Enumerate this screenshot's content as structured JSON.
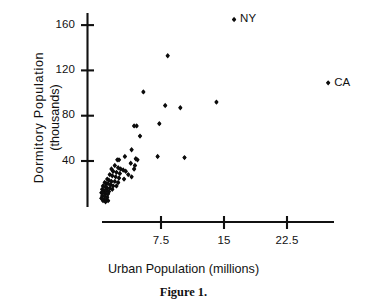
{
  "chart_data": {
    "type": "scatter",
    "title": "",
    "caption": "Figure 1.",
    "xlabel": "Urban Population (millions)",
    "ylabel_line1": "Dormitory  Population",
    "ylabel_line2": "(thousands)",
    "xlim": [
      0,
      28
    ],
    "ylim": [
      0,
      178
    ],
    "grid": false,
    "legend": "none",
    "xticks": [
      7.5,
      15,
      22.5
    ],
    "xtick_labels": [
      "7.5",
      "15",
      "22.5"
    ],
    "yticks": [
      40,
      80,
      120,
      160
    ],
    "ytick_labels": [
      "40",
      "80",
      "120",
      "160"
    ],
    "marker": "filled-diamond",
    "point_label_NY": "NY",
    "point_label_CA": "CA",
    "points": [
      {
        "x": 16.2,
        "y": 165,
        "label": "NY"
      },
      {
        "x": 27.4,
        "y": 109,
        "label": "CA"
      },
      {
        "x": 8.3,
        "y": 133
      },
      {
        "x": 5.4,
        "y": 101
      },
      {
        "x": 8.0,
        "y": 89
      },
      {
        "x": 9.8,
        "y": 87
      },
      {
        "x": 14.1,
        "y": 92
      },
      {
        "x": 7.3,
        "y": 73
      },
      {
        "x": 4.6,
        "y": 71
      },
      {
        "x": 4.3,
        "y": 71
      },
      {
        "x": 5.0,
        "y": 62
      },
      {
        "x": 4.0,
        "y": 50
      },
      {
        "x": 3.2,
        "y": 44
      },
      {
        "x": 4.5,
        "y": 42
      },
      {
        "x": 4.7,
        "y": 41
      },
      {
        "x": 7.1,
        "y": 44
      },
      {
        "x": 10.3,
        "y": 43
      },
      {
        "x": 2.5,
        "y": 41
      },
      {
        "x": 2.3,
        "y": 41
      },
      {
        "x": 3.9,
        "y": 38
      },
      {
        "x": 4.4,
        "y": 36
      },
      {
        "x": 4.3,
        "y": 33
      },
      {
        "x": 2.0,
        "y": 36
      },
      {
        "x": 2.4,
        "y": 34
      },
      {
        "x": 2.7,
        "y": 33
      },
      {
        "x": 3.0,
        "y": 32
      },
      {
        "x": 3.3,
        "y": 31
      },
      {
        "x": 1.6,
        "y": 33
      },
      {
        "x": 1.8,
        "y": 31
      },
      {
        "x": 2.2,
        "y": 30
      },
      {
        "x": 2.6,
        "y": 29
      },
      {
        "x": 3.6,
        "y": 28
      },
      {
        "x": 4.0,
        "y": 26
      },
      {
        "x": 1.4,
        "y": 28
      },
      {
        "x": 1.7,
        "y": 27
      },
      {
        "x": 2.1,
        "y": 26
      },
      {
        "x": 2.5,
        "y": 25
      },
      {
        "x": 3.1,
        "y": 24
      },
      {
        "x": 1.1,
        "y": 24
      },
      {
        "x": 1.3,
        "y": 23
      },
      {
        "x": 1.6,
        "y": 22
      },
      {
        "x": 2.0,
        "y": 22
      },
      {
        "x": 2.4,
        "y": 21
      },
      {
        "x": 0.8,
        "y": 21
      },
      {
        "x": 1.0,
        "y": 20
      },
      {
        "x": 1.2,
        "y": 20
      },
      {
        "x": 1.5,
        "y": 19
      },
      {
        "x": 1.8,
        "y": 18
      },
      {
        "x": 2.2,
        "y": 18
      },
      {
        "x": 0.6,
        "y": 18
      },
      {
        "x": 0.9,
        "y": 17
      },
      {
        "x": 1.1,
        "y": 16
      },
      {
        "x": 1.4,
        "y": 16
      },
      {
        "x": 1.7,
        "y": 15
      },
      {
        "x": 0.5,
        "y": 15
      },
      {
        "x": 0.7,
        "y": 14
      },
      {
        "x": 1.0,
        "y": 14
      },
      {
        "x": 1.3,
        "y": 13
      },
      {
        "x": 0.4,
        "y": 12
      },
      {
        "x": 0.6,
        "y": 12
      },
      {
        "x": 0.9,
        "y": 11
      },
      {
        "x": 1.2,
        "y": 11
      },
      {
        "x": 0.5,
        "y": 9
      },
      {
        "x": 0.8,
        "y": 9
      },
      {
        "x": 1.1,
        "y": 8
      },
      {
        "x": 0.4,
        "y": 7
      },
      {
        "x": 0.7,
        "y": 6
      },
      {
        "x": 1.0,
        "y": 6
      },
      {
        "x": 0.6,
        "y": 5
      },
      {
        "x": 0.9,
        "y": 4
      },
      {
        "x": 1.2,
        "y": 5
      }
    ]
  },
  "axes": {
    "x_axis_name": "urban-population-axis",
    "y_axis_name": "dormitory-population-axis"
  }
}
